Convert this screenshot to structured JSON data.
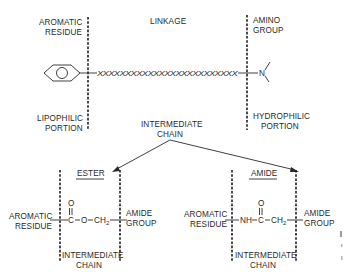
{
  "top_section": {
    "aromatic_residue": [
      "AROMATIC",
      "RESIDUE"
    ],
    "linkage": "LINKAGE",
    "amino_group": [
      "AMINO",
      "GROUP"
    ],
    "lipophilic_portion": [
      "LIPOPHILIC",
      "PORTION"
    ],
    "hydrophilic_portion": [
      "HYDROPHILIC",
      "PORTION"
    ],
    "linkage_chain": "XXXXXXXXXXXXXXXXXXXXXXXXX",
    "nitrogen": "N",
    "aromatic_ring": "benzene-ring"
  },
  "branch": {
    "intermediate_chain": [
      "INTERMEDIATE",
      "CHAIN"
    ]
  },
  "ester": {
    "title": "ESTER",
    "left_label": [
      "AROMATIC",
      "RESIDUE"
    ],
    "right_label": [
      "AMIDE",
      "GROUP"
    ],
    "carbonyl_o": "O",
    "formula": [
      "C",
      "O",
      "CH",
      "2"
    ],
    "bottom_label": [
      "INTERMEDIATE",
      "CHAIN"
    ]
  },
  "amide": {
    "title": "AMIDE",
    "left_label": [
      "AROMATIC",
      "RESIDUE"
    ],
    "right_label": [
      "AMIDE",
      "GROUP"
    ],
    "carbonyl_o": "O",
    "formula": [
      "NH",
      "C",
      "CH",
      "2"
    ],
    "bottom_label": [
      "INTERMEDIATE",
      "CHAIN"
    ]
  }
}
